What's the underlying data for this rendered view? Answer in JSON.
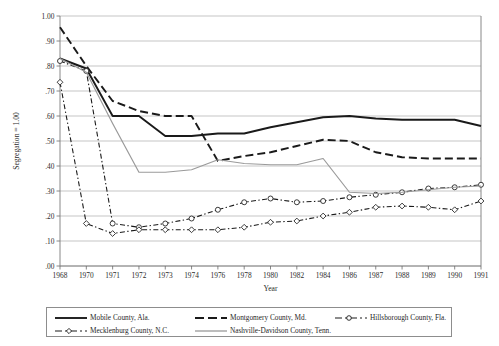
{
  "chart_data": {
    "type": "line",
    "title": "",
    "xlabel": "Year",
    "ylabel": "Segregation = 1.00",
    "ylim": [
      0.0,
      1.0
    ],
    "ytick_labels": [
      "1.00",
      ".90",
      ".80",
      ".70",
      ".60",
      ".50",
      ".40",
      ".30",
      ".20",
      ".10",
      ".00"
    ],
    "ytick_values": [
      1.0,
      0.9,
      0.8,
      0.7,
      0.6,
      0.5,
      0.4,
      0.3,
      0.2,
      0.1,
      0.0
    ],
    "grid": true,
    "legend_position": "bottom",
    "categories": [
      "1968",
      "1970",
      "1971",
      "1972",
      "1973",
      "1974",
      "1976",
      "1978",
      "1980",
      "1982",
      "1984",
      "1986",
      "1987",
      "1988",
      "1989",
      "1990",
      "1991"
    ],
    "series": [
      {
        "name": "Mobile County, Ala.",
        "style": "solid",
        "color": "#1a1a1a",
        "width": 1.9,
        "marker": "none",
        "values": [
          0.83,
          0.79,
          0.6,
          0.6,
          0.52,
          0.52,
          0.53,
          0.53,
          0.555,
          0.575,
          0.595,
          0.6,
          0.59,
          0.585,
          0.585,
          0.585,
          0.56
        ]
      },
      {
        "name": "Montgomery County, Md.",
        "style": "dashed",
        "color": "#1a1a1a",
        "width": 1.9,
        "marker": "none",
        "values": [
          0.955,
          0.8,
          0.66,
          0.62,
          0.6,
          0.6,
          0.42,
          0.44,
          0.455,
          0.48,
          0.505,
          0.5,
          0.455,
          0.435,
          0.43,
          0.43,
          0.43
        ]
      },
      {
        "name": "Hillsborough County, Fla.",
        "style": "dashdot",
        "color": "#1a1a1a",
        "width": 1.1,
        "marker": "circle",
        "values": [
          0.82,
          0.78,
          0.17,
          0.155,
          0.17,
          0.19,
          0.225,
          0.255,
          0.27,
          0.255,
          0.26,
          0.275,
          0.285,
          0.295,
          0.31,
          0.315,
          0.325
        ]
      },
      {
        "name": "Mecklenburg County, N.C.",
        "style": "dashdot",
        "color": "#1a1a1a",
        "width": 1.1,
        "marker": "diamond",
        "values": [
          0.735,
          0.17,
          0.13,
          0.145,
          0.145,
          0.145,
          0.145,
          0.155,
          0.175,
          0.18,
          0.2,
          0.215,
          0.235,
          0.24,
          0.235,
          0.225,
          0.26
        ]
      },
      {
        "name": "Nashville-Davidson County, Tenn.",
        "style": "solid",
        "color": "#9a9a9a",
        "width": 1.2,
        "marker": "none",
        "values": [
          0.83,
          0.775,
          0.57,
          0.375,
          0.375,
          0.385,
          0.425,
          0.41,
          0.405,
          0.405,
          0.43,
          0.295,
          0.29,
          0.295,
          0.305,
          0.315,
          0.32
        ]
      }
    ]
  }
}
